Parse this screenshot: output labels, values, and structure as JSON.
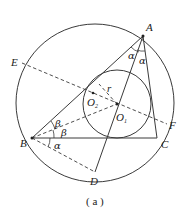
{
  "figure": {
    "caption": "( a )",
    "points": {
      "A": {
        "label": "A"
      },
      "B": {
        "label": "B"
      },
      "C": {
        "label": "C"
      },
      "D": {
        "label": "D"
      },
      "E": {
        "label": "E"
      },
      "F": {
        "label": "F"
      },
      "O1": {
        "label": "O",
        "subscript": "1"
      },
      "O2": {
        "label": "O",
        "subscript": "2"
      }
    },
    "angles": {
      "alpha": "α",
      "beta": "β"
    },
    "radius_label": "r",
    "colors": {
      "stroke": "#3a3a3a",
      "text": "#222222",
      "background": "#ffffff"
    }
  }
}
